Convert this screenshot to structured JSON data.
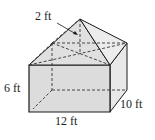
{
  "figure": {
    "type": "composite solid: rectangular prism with square pyramid on top",
    "labels": {
      "pyramid_height": "2 ft",
      "prism_height": "6 ft",
      "length": "12 ft",
      "width": "10 ft"
    },
    "colors": {
      "front_face": "#d9d9d9",
      "side_face": "#e6e6e6",
      "top_faces": "#e2e2e2",
      "edges": "#1a1a1a"
    }
  }
}
